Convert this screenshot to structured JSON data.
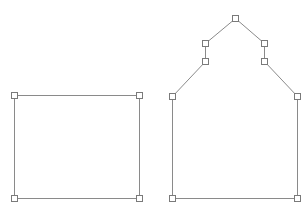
{
  "canvas": {
    "width": 305,
    "height": 209,
    "background": "#ffffff"
  },
  "colors": {
    "edge": "#8a8a8a",
    "handle_stroke": "#7a7a7a",
    "handle_fill": "#ffffff"
  },
  "handle_size": 6,
  "shapes": [
    {
      "name": "rectangle",
      "closed": true,
      "vertices": [
        [
          14,
          95
        ],
        [
          139,
          95
        ],
        [
          139,
          198
        ],
        [
          14,
          198
        ]
      ]
    },
    {
      "name": "house-pentagon",
      "closed": true,
      "vertices": [
        [
          235,
          18
        ],
        [
          264,
          43
        ],
        [
          264,
          61
        ],
        [
          297,
          96
        ],
        [
          297,
          198
        ],
        [
          172,
          198
        ],
        [
          172,
          96
        ],
        [
          205,
          61
        ],
        [
          205,
          43
        ]
      ]
    }
  ]
}
